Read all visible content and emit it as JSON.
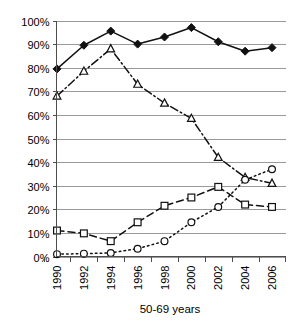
{
  "chart_data": {
    "type": "line",
    "title": "",
    "subtitle": "",
    "xlabel": "50-69 years",
    "ylabel": "",
    "categories": [
      "1990",
      "1992",
      "1994",
      "1996",
      "1998",
      "2000",
      "2002",
      "2004",
      "2006"
    ],
    "x": [
      1990,
      1992,
      1994,
      1996,
      1998,
      2000,
      2002,
      2004,
      2006
    ],
    "ylim": [
      0,
      100
    ],
    "yticks": [
      0,
      10,
      20,
      30,
      40,
      50,
      60,
      70,
      80,
      90,
      100
    ],
    "ytick_labels": [
      "0%",
      "10%",
      "20%",
      "30%",
      "40%",
      "50%",
      "60%",
      "70%",
      "80%",
      "90%",
      "100%"
    ],
    "xtick_labels": [
      "1990",
      "1992",
      "1994",
      "1996",
      "1998",
      "2000",
      "2002",
      "2004",
      "2006"
    ],
    "grid": "horizontal",
    "legend": "none",
    "y_unit": "percent",
    "series": [
      {
        "name": "series-1",
        "marker": "filled-diamond",
        "linestyle": "solid",
        "color": "#111111",
        "values": [
          79.5,
          89.5,
          95.5,
          90.0,
          93.0,
          97.0,
          91.0,
          87.0,
          88.5
        ]
      },
      {
        "name": "series-2",
        "marker": "open-triangle",
        "linestyle": "dash-dot",
        "color": "#111111",
        "values": [
          68.0,
          78.5,
          88.0,
          73.0,
          65.0,
          58.5,
          42.0,
          33.5,
          31.0
        ]
      },
      {
        "name": "series-3",
        "marker": "open-square",
        "linestyle": "dashed",
        "color": "#111111",
        "values": [
          11.0,
          9.8,
          6.5,
          14.5,
          21.5,
          25.0,
          29.5,
          22.0,
          21.0
        ]
      },
      {
        "name": "series-4",
        "marker": "open-circle",
        "linestyle": "dotted",
        "color": "#111111",
        "values": [
          1.0,
          1.2,
          1.5,
          3.3,
          6.5,
          14.5,
          21.0,
          32.5,
          37.0
        ]
      }
    ]
  },
  "axis": {
    "x_title": "50-69 years"
  }
}
